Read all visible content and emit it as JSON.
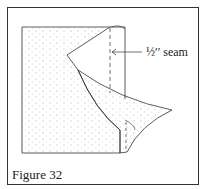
{
  "figure": {
    "caption": "Figure 32",
    "annotation": "½′′ seam"
  },
  "colors": {
    "line": "#333333",
    "fabric_dots": "#999999",
    "background": "#ffffff"
  }
}
